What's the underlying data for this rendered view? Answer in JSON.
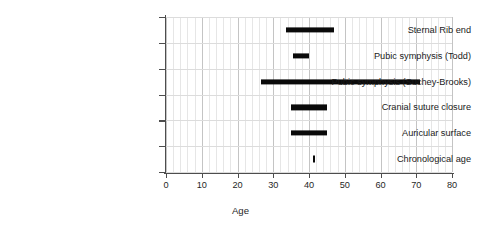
{
  "chart_data": {
    "type": "bar",
    "orientation": "horizontal",
    "title": "",
    "xlabel": "Age",
    "ylabel": "",
    "xlim": [
      0,
      80
    ],
    "xticks": [
      0,
      10,
      20,
      30,
      40,
      50,
      60,
      70,
      80
    ],
    "xtick_labels": [
      "0",
      "10",
      "20",
      "30",
      "40",
      "50",
      "60",
      "70",
      "80"
    ],
    "grid": true,
    "grid_minor_step": 2,
    "grid_major_step": 10,
    "legend": "none",
    "bar_color": "#0a0a0a",
    "categories": [
      "Sternal Rib end",
      "Pubic symphysis (Todd)",
      "Pubic symphysis (Suchey-Brooks)",
      "Cranial suture closure",
      "Auricular surface",
      "Chronological age"
    ],
    "ranges": [
      {
        "label": "Sternal Rib end",
        "start": 33.5,
        "end": 47.0
      },
      {
        "label": "Pubic symphysis (Todd)",
        "start": 35.5,
        "end": 40.0
      },
      {
        "label": "Pubic symphysis (Suchey-Brooks)",
        "start": 26.5,
        "end": 71.0
      },
      {
        "label": "Cranial suture closure",
        "start": 35.0,
        "end": 45.0
      },
      {
        "label": "Auricular surface",
        "start": 35.0,
        "end": 45.0
      },
      {
        "label": "Chronological age",
        "start": 41.0,
        "end": 41.8
      }
    ]
  }
}
